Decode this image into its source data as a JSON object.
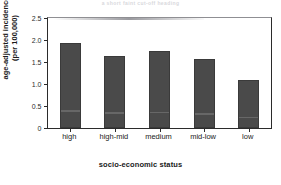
{
  "figure": {
    "title_faint": "a short faint cut-off heading",
    "background_color": "#ffffff",
    "bar_color": "#4a4a4a",
    "axis_color": "#2b2b2b"
  },
  "chart_data": {
    "type": "bar",
    "title": "",
    "xlabel": "socio-economic status",
    "ylabel": "age-adjusted incidence (per 100,000)",
    "ylabel_line1": "age-adjusted incidence",
    "ylabel_line2": "(per 100,000)",
    "categories": [
      "high",
      "high-mid",
      "medium",
      "mid-low",
      "low"
    ],
    "values": [
      1.92,
      1.63,
      1.73,
      1.56,
      1.08
    ],
    "ylim": [
      0,
      2.5
    ],
    "yticks": [
      0,
      0.5,
      1.0,
      1.5,
      2.0,
      2.5
    ],
    "ytick_labels": [
      "0",
      "0.5",
      "1.0",
      "1.5",
      "2.0",
      "2.5"
    ],
    "grid": false,
    "legend": null,
    "series": [
      {
        "name": "age-adjusted incidence",
        "values": [
          1.92,
          1.63,
          1.73,
          1.56,
          1.08
        ]
      }
    ]
  }
}
